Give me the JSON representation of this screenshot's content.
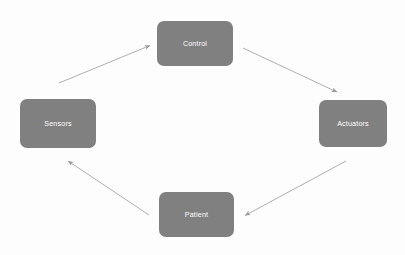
{
  "diagram": {
    "type": "closed-loop-cycle",
    "background_color": "#fdfdfd",
    "node_fill_color": "#808080",
    "node_text_color": "#ffffff",
    "arrow_color": "#9a9a9a",
    "nodes": [
      {
        "id": "control",
        "label": "Control",
        "position": "top"
      },
      {
        "id": "actuators",
        "label": "Actuators",
        "position": "right"
      },
      {
        "id": "patient",
        "label": "Patient",
        "position": "bottom"
      },
      {
        "id": "sensors",
        "label": "Sensors",
        "position": "left"
      }
    ],
    "edges": [
      {
        "id": "sensors-to-control",
        "from": "sensors",
        "to": "control",
        "label": ""
      },
      {
        "id": "control-to-actuators",
        "from": "control",
        "to": "actuators",
        "label": ""
      },
      {
        "id": "actuators-to-patient",
        "from": "actuators",
        "to": "patient",
        "label": ""
      },
      {
        "id": "patient-to-sensors",
        "from": "patient",
        "to": "sensors",
        "label": ""
      }
    ]
  }
}
